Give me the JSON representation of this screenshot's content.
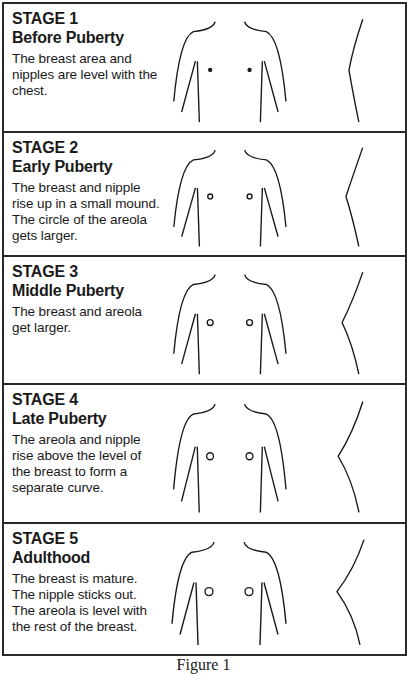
{
  "figure": {
    "caption": "Figure 1",
    "stages": [
      {
        "stage": "STAGE 1",
        "phase": "Before Puberty",
        "desc": "The breast area and nipples are level with the chest.",
        "height": 129,
        "level": 1
      },
      {
        "stage": "STAGE 2",
        "phase": "Early Puberty",
        "desc": "The breast and nipple rise up in a small mound. The circle of the areola gets larger.",
        "height": 124,
        "level": 2
      },
      {
        "stage": "STAGE 3",
        "phase": "Middle Puberty",
        "desc": "The breast and areola get larger.",
        "height": 128,
        "level": 3
      },
      {
        "stage": "STAGE 4",
        "phase": "Late Puberty",
        "desc": "The areola and nipple rise above the level of the breast to form a separate curve.",
        "height": 139,
        "level": 4
      },
      {
        "stage": "STAGE 5",
        "phase": "Adulthood",
        "desc": "The breast is mature. The nipple sticks out. The areola is level with the rest of the breast.",
        "height": 130,
        "level": 5
      }
    ]
  },
  "colors": {
    "line": "#1a1a1a",
    "border": "#2a2a2a",
    "background": "#ffffff"
  }
}
